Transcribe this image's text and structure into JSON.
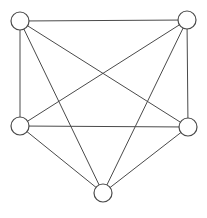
{
  "diagram": {
    "type": "graph",
    "nodes": [
      {
        "id": "top-left",
        "label": ""
      },
      {
        "id": "top-right",
        "label": ""
      },
      {
        "id": "middle-left",
        "label": ""
      },
      {
        "id": "middle-right",
        "label": ""
      },
      {
        "id": "bottom",
        "label": ""
      }
    ],
    "edges": [
      [
        "top-left",
        "top-right"
      ],
      [
        "top-left",
        "middle-left"
      ],
      [
        "top-left",
        "middle-right"
      ],
      [
        "top-left",
        "bottom"
      ],
      [
        "top-right",
        "middle-right"
      ],
      [
        "top-right",
        "middle-left"
      ],
      [
        "top-right",
        "bottom"
      ],
      [
        "middle-left",
        "middle-right"
      ],
      [
        "middle-left",
        "bottom"
      ],
      [
        "middle-right",
        "bottom"
      ]
    ],
    "colors": {
      "stroke": "#4a4a4a",
      "node_fill": "#ffffff",
      "background": "#ffffff"
    }
  }
}
